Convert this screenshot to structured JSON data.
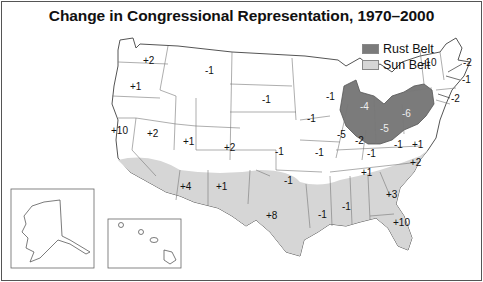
{
  "title": "Change in Congressional Representation, 1970–2000",
  "legend": [
    {
      "label": "Rust Belt",
      "color": "#7b7b7b"
    },
    {
      "label": "Sun Belt",
      "color": "#d6d6d6"
    }
  ],
  "colors": {
    "rust_belt": "#7b7b7b",
    "sun_belt": "#d6d6d6",
    "state_border": "#777777",
    "background": "#ffffff"
  },
  "states": [
    {
      "name": "WA",
      "label": "+2",
      "x": 148,
      "y": 61
    },
    {
      "name": "OR",
      "label": "+1",
      "x": 136,
      "y": 88
    },
    {
      "name": "CA",
      "label": "+10",
      "x": 119,
      "y": 131
    },
    {
      "name": "NV",
      "label": "+2",
      "x": 153,
      "y": 135
    },
    {
      "name": "ID_UT",
      "label": "+1",
      "x": 189,
      "y": 143
    },
    {
      "name": "MT",
      "label": "-1",
      "x": 209,
      "y": 71
    },
    {
      "name": "ND_SD",
      "label": "-1",
      "x": 266,
      "y": 100
    },
    {
      "name": "CO",
      "label": "+2",
      "x": 230,
      "y": 148
    },
    {
      "name": "KS",
      "label": "-1",
      "x": 279,
      "y": 153
    },
    {
      "name": "IA",
      "label": "-1",
      "x": 311,
      "y": 119
    },
    {
      "name": "MO",
      "label": "-1",
      "x": 319,
      "y": 154
    },
    {
      "name": "OK",
      "label": "-1",
      "x": 288,
      "y": 182
    },
    {
      "name": "AZ",
      "label": "+4",
      "x": 186,
      "y": 188
    },
    {
      "name": "NM",
      "label": "+1",
      "x": 222,
      "y": 188
    },
    {
      "name": "TX",
      "label": "+8",
      "x": 272,
      "y": 217
    },
    {
      "name": "WI",
      "label": "-1",
      "x": 330,
      "y": 97
    },
    {
      "name": "IL",
      "label": "-5",
      "x": 341,
      "y": 135
    },
    {
      "name": "IN",
      "label": "-2",
      "x": 359,
      "y": 142
    },
    {
      "name": "KY",
      "label": "-1",
      "x": 371,
      "y": 154
    },
    {
      "name": "MI",
      "label": "-4",
      "x": 364,
      "y": 108
    },
    {
      "name": "OH",
      "label": "-5",
      "x": 384,
      "y": 130
    },
    {
      "name": "PA",
      "label": "-6",
      "x": 406,
      "y": 115
    },
    {
      "name": "WV",
      "label": "-1",
      "x": 398,
      "y": 146
    },
    {
      "name": "VA",
      "label": "+1",
      "x": 416,
      "y": 146
    },
    {
      "name": "NC",
      "label": "+2",
      "x": 416,
      "y": 163
    },
    {
      "name": "TN",
      "label": "+1",
      "x": 367,
      "y": 173
    },
    {
      "name": "AR",
      "label": "-1",
      "x": 324,
      "y": 212
    },
    {
      "name": "LA",
      "label": "-1",
      "x": 323,
      "y": 215
    },
    {
      "name": "MS",
      "label": "-1",
      "x": 344,
      "y": 205
    },
    {
      "name": "GA",
      "label": "+3",
      "x": 390,
      "y": 195
    },
    {
      "name": "FL",
      "label": "+10",
      "x": 397,
      "y": 223
    },
    {
      "name": "NY",
      "label": "-10",
      "x": 427,
      "y": 63
    },
    {
      "name": "MA",
      "label": "-2",
      "x": 467,
      "y": 63
    },
    {
      "name": "CT",
      "label": "-1",
      "x": 466,
      "y": 78
    },
    {
      "name": "NJ",
      "label": "-2",
      "x": 454,
      "y": 98
    }
  ],
  "insets": [
    {
      "name": "Alaska"
    },
    {
      "name": "Hawaii"
    }
  ]
}
